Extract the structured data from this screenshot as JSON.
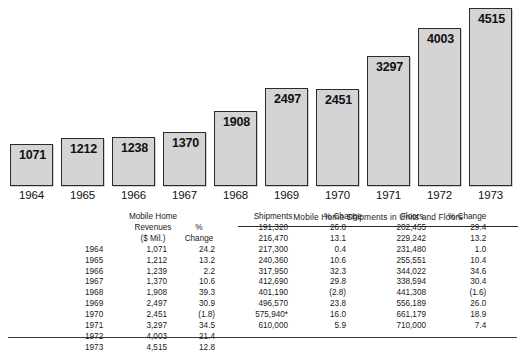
{
  "chart_data": {
    "type": "bar",
    "title": "",
    "xlabel": "",
    "ylabel": "",
    "ylim": [
      0,
      4800
    ],
    "grid": false,
    "legend": "none",
    "categories": [
      "1964",
      "1965",
      "1966",
      "1967",
      "1968",
      "1969",
      "1970",
      "1971",
      "1972",
      "1973"
    ],
    "values": [
      1071,
      1212,
      1238,
      1370,
      1908,
      2497,
      2451,
      3297,
      4003,
      4515
    ],
    "bar_labels": [
      "1071",
      "1212",
      "1238",
      "1370",
      "1908",
      "2497",
      "2451",
      "3297",
      "4003",
      "4515"
    ],
    "bar_fill_color": "#d4d4d4",
    "bar_border_color": "#2b2b2b"
  },
  "table": {
    "left": {
      "header": {
        "year": "",
        "revenues_line1": "Mobile Home",
        "revenues_line2": "Revenues",
        "revenues_line3": "($ Mil.)",
        "change_line1": "%",
        "change_line2": "Change"
      },
      "rows": [
        {
          "year": "1964",
          "revenues": "1,071",
          "change": "24.2"
        },
        {
          "year": "1965",
          "revenues": "1,212",
          "change": "13.2"
        },
        {
          "year": "1966",
          "revenues": "1,239",
          "change": "2.2"
        },
        {
          "year": "1967",
          "revenues": "1,370",
          "change": "10.6"
        },
        {
          "year": "1968",
          "revenues": "1,908",
          "change": "39.3"
        },
        {
          "year": "1969",
          "revenues": "2,497",
          "change": "30.9"
        },
        {
          "year": "1970",
          "revenues": "2,451",
          "change": "(1.8)"
        },
        {
          "year": "1971",
          "revenues": "3,297",
          "change": "34.5"
        },
        {
          "year": "1972",
          "revenues": "4,003",
          "change": "21.4"
        },
        {
          "year": "1973",
          "revenues": "4,515",
          "change": "12.8"
        }
      ]
    },
    "right": {
      "title": "Mobile Home Shipments in Units and Floors",
      "header": {
        "shipments": "Shipments",
        "shipments_change": "% Change",
        "floors": "Floors",
        "floors_change": "% Change"
      },
      "rows": [
        {
          "shipments": "191,320",
          "shipments_change": "26.8",
          "floors": "202,455",
          "floors_change": "29.4"
        },
        {
          "shipments": "216,470",
          "shipments_change": "13.1",
          "floors": "229,242",
          "floors_change": "13.2"
        },
        {
          "shipments": "217,300",
          "shipments_change": "0.4",
          "floors": "231,480",
          "floors_change": "1.0"
        },
        {
          "shipments": "240,360",
          "shipments_change": "10.6",
          "floors": "255,551",
          "floors_change": "10.4"
        },
        {
          "shipments": "317,950",
          "shipments_change": "32.3",
          "floors": "344,022",
          "floors_change": "34.6"
        },
        {
          "shipments": "412,690",
          "shipments_change": "29.8",
          "floors": "338,594",
          "floors_change": "30.4"
        },
        {
          "shipments": "401,190",
          "shipments_change": "(2.8)",
          "floors": "441,308",
          "floors_change": "(1.6)"
        },
        {
          "shipments": "496,570",
          "shipments_change": "23.8",
          "floors": "556,189",
          "floors_change": "26.0"
        },
        {
          "shipments": "575,940*",
          "shipments_change": "16.0",
          "floors": "661,179",
          "floors_change": "18.9"
        },
        {
          "shipments": "610,000",
          "shipments_change": "5.9",
          "floors": "710,000",
          "floors_change": "7.4"
        }
      ]
    }
  }
}
